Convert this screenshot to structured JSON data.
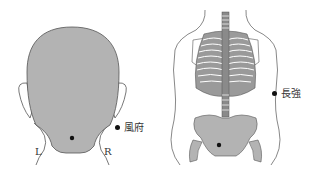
{
  "diagrams": [
    {
      "name": "head-back-view",
      "point_label": "風府",
      "side_labels": {
        "left": "L",
        "right": "R"
      }
    },
    {
      "name": "torso-back-skeleton-view",
      "point_label": "長強"
    }
  ],
  "colors": {
    "fill": "#b3b3b3",
    "outline": "#555555",
    "point": "#111111",
    "background": "#ffffff"
  }
}
